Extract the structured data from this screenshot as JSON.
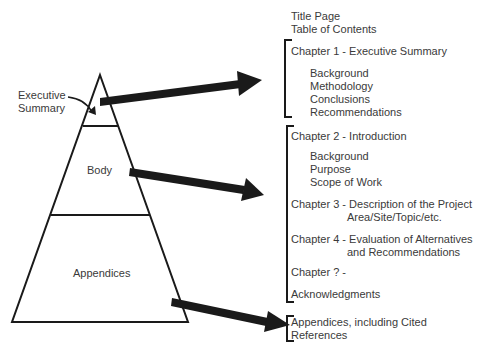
{
  "pyramid": {
    "sections": [
      {
        "label": "Executive Summary",
        "lines": [
          "Executive",
          "Summary"
        ]
      },
      {
        "label": "Body"
      },
      {
        "label": "Appendices"
      }
    ]
  },
  "outline": {
    "front": [
      "Title Page",
      "Table of Contents"
    ],
    "group1": {
      "chapter": "Chapter 1 - Executive Summary",
      "items": [
        "Background",
        "Methodology",
        "Conclusions",
        "Recommendations"
      ]
    },
    "group2": {
      "chapter2": "Chapter 2 - Introduction",
      "chapter2_items": [
        "Background",
        "Purpose",
        "Scope of Work"
      ],
      "chapter3_line1": "Chapter 3 - Description of the Project",
      "chapter3_line2": "Area/Site/Topic/etc.",
      "chapter4_line1": "Chapter 4 - Evaluation of Alternatives",
      "chapter4_line2": "and Recommendations",
      "chapter_n": "Chapter ? -",
      "acknowledgments": "Acknowledgments"
    },
    "group3": {
      "line1": "Appendices, including Cited",
      "line2": "References"
    }
  },
  "colors": {
    "stroke": "#1a1a1a",
    "text": "#3a3a3a",
    "background": "#ffffff"
  }
}
